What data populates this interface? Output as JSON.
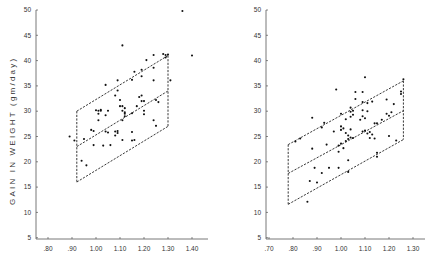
{
  "chart_data": [
    {
      "type": "scatter",
      "title": "",
      "ylabel": "GAIN IN WEIGHT (gm/day)",
      "xlabel": "",
      "xlim": [
        0.75,
        1.45
      ],
      "ylim": [
        5,
        50
      ],
      "x_ticks": [
        ".80",
        ".90",
        "1.00",
        "1.10",
        "1.20",
        "1.30",
        "1.40"
      ],
      "y_ticks": [
        "5",
        "10",
        "15",
        "20",
        "25",
        "30",
        "35",
        "40",
        "45",
        "50"
      ],
      "grid": false,
      "legend": null,
      "annotations": [
        {
          "type": "parallelogram_band",
          "style": "dashed",
          "x_range": [
            0.92,
            1.3
          ],
          "upper": {
            "x": [
              0.92,
              1.3
            ],
            "y": [
              30,
              41
            ]
          },
          "center": {
            "x": [
              0.92,
              1.3
            ],
            "y": [
              23,
              34
            ]
          },
          "lower": {
            "x": [
              0.92,
              1.3
            ],
            "y": [
              16,
              27
            ]
          }
        }
      ],
      "points": [
        [
          0.89,
          25
        ],
        [
          0.91,
          24.2
        ],
        [
          0.94,
          20.2
        ],
        [
          0.95,
          24.5
        ],
        [
          0.96,
          19.3
        ],
        [
          0.98,
          26.3
        ],
        [
          0.99,
          23.3
        ],
        [
          0.99,
          26.1
        ],
        [
          1.0,
          30.2
        ],
        [
          1.01,
          28.2
        ],
        [
          1.01,
          29.5
        ],
        [
          1.01,
          30.1
        ],
        [
          1.02,
          30.1
        ],
        [
          1.02,
          30.3
        ],
        [
          1.03,
          23.2
        ],
        [
          1.04,
          29.2
        ],
        [
          1.04,
          26.0
        ],
        [
          1.04,
          35.2
        ],
        [
          1.05,
          30.1
        ],
        [
          1.05,
          25.8
        ],
        [
          1.06,
          23.3
        ],
        [
          1.08,
          26.0
        ],
        [
          1.08,
          25.2
        ],
        [
          1.08,
          33.1
        ],
        [
          1.09,
          36.1
        ],
        [
          1.09,
          34.1
        ],
        [
          1.09,
          26.1
        ],
        [
          1.09,
          25.7
        ],
        [
          1.1,
          32.2
        ],
        [
          1.1,
          31.0
        ],
        [
          1.11,
          30.1
        ],
        [
          1.11,
          28.2
        ],
        [
          1.11,
          24.3
        ],
        [
          1.11,
          43.0
        ],
        [
          1.11,
          31.0
        ],
        [
          1.12,
          30.6
        ],
        [
          1.12,
          29.5
        ],
        [
          1.12,
          29.8
        ],
        [
          1.12,
          29.0
        ],
        [
          1.15,
          36.2
        ],
        [
          1.15,
          29.6
        ],
        [
          1.15,
          25.9
        ],
        [
          1.15,
          24.2
        ],
        [
          1.16,
          37.8
        ],
        [
          1.16,
          24.3
        ],
        [
          1.17,
          31.0
        ],
        [
          1.18,
          32.8
        ],
        [
          1.19,
          38.2
        ],
        [
          1.19,
          36.9
        ],
        [
          1.19,
          33.1
        ],
        [
          1.19,
          32.0
        ],
        [
          1.2,
          30.1
        ],
        [
          1.2,
          29.4
        ],
        [
          1.2,
          32.0
        ],
        [
          1.21,
          40.1
        ],
        [
          1.24,
          41.1
        ],
        [
          1.24,
          38.6
        ],
        [
          1.24,
          36.1
        ],
        [
          1.24,
          28.2
        ],
        [
          1.25,
          27.1
        ],
        [
          1.25,
          32.2
        ],
        [
          1.26,
          31.8
        ],
        [
          1.28,
          41.3
        ],
        [
          1.29,
          41.1
        ],
        [
          1.29,
          40.6
        ],
        [
          1.3,
          41.2
        ],
        [
          1.31,
          36.1
        ],
        [
          1.36,
          49.8
        ],
        [
          1.4,
          41.0
        ]
      ]
    },
    {
      "type": "scatter",
      "title": "",
      "ylabel": "",
      "xlabel": "",
      "xlim": [
        0.69,
        1.35
      ],
      "ylim": [
        5,
        50
      ],
      "x_ticks": [
        ".70",
        ".80",
        ".90",
        "1.00",
        "1.10",
        "1.20",
        "1.30"
      ],
      "y_ticks": [
        "5",
        "10",
        "15",
        "20",
        "25",
        "30",
        "35",
        "40",
        "45",
        "50"
      ],
      "grid": false,
      "legend": null,
      "annotations": [
        {
          "type": "parallelogram_band",
          "style": "dashed",
          "x_range": [
            0.78,
            1.26
          ],
          "upper": {
            "x": [
              0.78,
              1.26
            ],
            "y": [
              23.4,
              36.0
            ]
          },
          "center": {
            "x": [
              0.78,
              1.26
            ],
            "y": [
              17.7,
              30.1
            ]
          },
          "lower": {
            "x": [
              0.78,
              1.26
            ],
            "y": [
              11.6,
              24.4
            ]
          }
        }
      ],
      "points": [
        [
          0.81,
          24.0
        ],
        [
          0.83,
          24.6
        ],
        [
          0.86,
          12.1
        ],
        [
          0.87,
          16.2
        ],
        [
          0.88,
          28.7
        ],
        [
          0.88,
          22.6
        ],
        [
          0.89,
          18.8
        ],
        [
          0.9,
          15.9
        ],
        [
          0.92,
          17.8
        ],
        [
          0.92,
          26.8
        ],
        [
          0.93,
          27.7
        ],
        [
          0.94,
          23.4
        ],
        [
          0.95,
          18.8
        ],
        [
          0.97,
          26.0
        ],
        [
          0.98,
          34.3
        ],
        [
          0.99,
          18.8
        ],
        [
          0.99,
          23.2
        ],
        [
          0.99,
          22.0
        ],
        [
          1.0,
          29.5
        ],
        [
          1.0,
          27.0
        ],
        [
          1.0,
          26.3
        ],
        [
          1.0,
          23.6
        ],
        [
          1.01,
          22.7
        ],
        [
          1.01,
          26.6
        ],
        [
          1.02,
          25.7
        ],
        [
          1.02,
          28.4
        ],
        [
          1.02,
          24.1
        ],
        [
          1.03,
          20.3
        ],
        [
          1.03,
          18.0
        ],
        [
          1.03,
          25.2
        ],
        [
          1.03,
          24.5
        ],
        [
          1.04,
          30.7
        ],
        [
          1.04,
          29.9
        ],
        [
          1.04,
          28.9
        ],
        [
          1.04,
          26.4
        ],
        [
          1.04,
          24.8
        ],
        [
          1.05,
          30.1
        ],
        [
          1.05,
          29.3
        ],
        [
          1.05,
          24.7
        ],
        [
          1.06,
          33.8
        ],
        [
          1.06,
          32.4
        ],
        [
          1.08,
          28.3
        ],
        [
          1.09,
          33.8
        ],
        [
          1.09,
          31.8
        ],
        [
          1.09,
          30.2
        ],
        [
          1.09,
          29.0
        ],
        [
          1.09,
          26.0
        ],
        [
          1.1,
          36.7
        ],
        [
          1.1,
          28.6
        ],
        [
          1.1,
          26.2
        ],
        [
          1.11,
          31.6
        ],
        [
          1.11,
          30.0
        ],
        [
          1.11,
          25.6
        ],
        [
          1.12,
          25.9
        ],
        [
          1.12,
          24.7
        ],
        [
          1.13,
          31.9
        ],
        [
          1.13,
          25.4
        ],
        [
          1.14,
          27.6
        ],
        [
          1.14,
          24.6
        ],
        [
          1.15,
          27.6
        ],
        [
          1.15,
          21.8
        ],
        [
          1.15,
          21.0
        ],
        [
          1.17,
          28.3
        ],
        [
          1.19,
          32.3
        ],
        [
          1.19,
          29.5
        ],
        [
          1.2,
          25.1
        ],
        [
          1.2,
          29.1
        ],
        [
          1.21,
          29.8
        ],
        [
          1.22,
          31.4
        ],
        [
          1.23,
          24.2
        ],
        [
          1.25,
          33.4
        ],
        [
          1.25,
          33.9
        ],
        [
          1.26,
          36.3
        ]
      ]
    }
  ],
  "layout": {
    "panels": [
      {
        "origin_px": 48,
        "origin_x": 0.8,
        "axis_x_px": 36,
        "axis_x_end_px": 208,
        "x_ticks_val": [
          0.8,
          0.9,
          1.0,
          1.1,
          1.2,
          1.3,
          1.4
        ]
      },
      {
        "origin_px": 269,
        "origin_x": 0.7,
        "axis_x_px": 266,
        "axis_x_end_px": 425,
        "x_ticks_val": [
          0.7,
          0.8,
          0.9,
          1.0,
          1.1,
          1.2,
          1.3
        ]
      }
    ]
  }
}
